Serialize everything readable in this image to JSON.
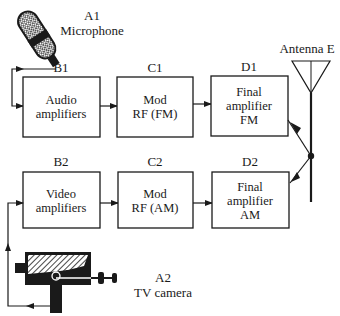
{
  "diagram": {
    "type": "block-diagram",
    "topic": "FM audio and AM video transmission to a shared antenna",
    "sources": {
      "microphone": {
        "id": "A1",
        "label": "Microphone",
        "icon": "microphone-icon"
      },
      "camera": {
        "id": "A2",
        "label": "TV camera",
        "icon": "tv-camera-icon"
      }
    },
    "blocks": {
      "b1": {
        "id": "B1",
        "lines": [
          "Audio",
          "amplifiers"
        ]
      },
      "c1": {
        "id": "C1",
        "lines": [
          "Mod",
          "RF (FM)"
        ]
      },
      "d1": {
        "id": "D1",
        "lines": [
          "Final",
          "amplifier",
          "FM"
        ]
      },
      "b2": {
        "id": "B2",
        "lines": [
          "Video",
          "amplifiers"
        ]
      },
      "c2": {
        "id": "C2",
        "lines": [
          "Mod",
          "RF (AM)"
        ]
      },
      "d2": {
        "id": "D2",
        "lines": [
          "Final",
          "amplifier",
          "AM"
        ]
      }
    },
    "antenna": {
      "label": "Antenna E",
      "icon": "antenna-icon"
    },
    "connections": [
      [
        "A1",
        "B1"
      ],
      [
        "B1",
        "C1"
      ],
      [
        "C1",
        "D1"
      ],
      [
        "D1",
        "E"
      ],
      [
        "A2",
        "B2"
      ],
      [
        "B2",
        "C2"
      ],
      [
        "C2",
        "D2"
      ],
      [
        "D2",
        "E"
      ]
    ]
  }
}
